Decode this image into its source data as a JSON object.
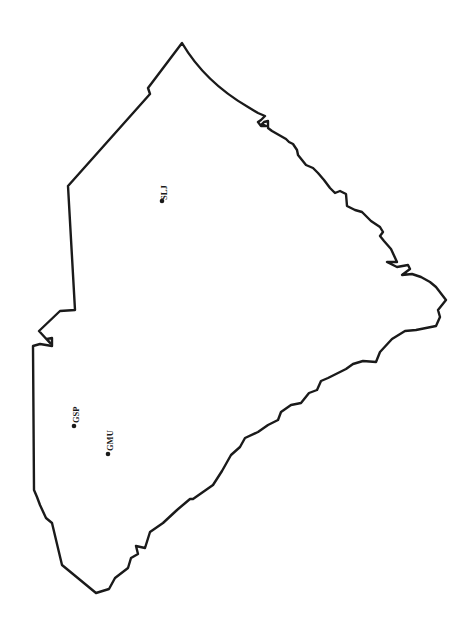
{
  "map": {
    "title": "",
    "boundary_color": "#1a1a1a",
    "background": "#ffffff",
    "stations": [
      {
        "id": "SLJ",
        "label": "SLJ",
        "x": 162,
        "y": 201
      },
      {
        "id": "GSP",
        "label": "GSP",
        "x": 74,
        "y": 426
      },
      {
        "id": "GMU",
        "label": "GMU",
        "x": 108,
        "y": 454
      }
    ]
  }
}
